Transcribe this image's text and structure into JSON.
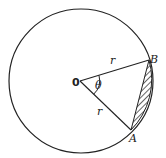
{
  "diagram": {
    "labels": {
      "center": "0",
      "point_b": "B",
      "point_a": "A",
      "radius_upper": "r",
      "radius_lower": "r",
      "angle": "θ"
    },
    "shaded_region": "segment between chord AB and arc AB (hatched)",
    "colors": {
      "stroke": "#222222",
      "background": "#ffffff"
    }
  }
}
